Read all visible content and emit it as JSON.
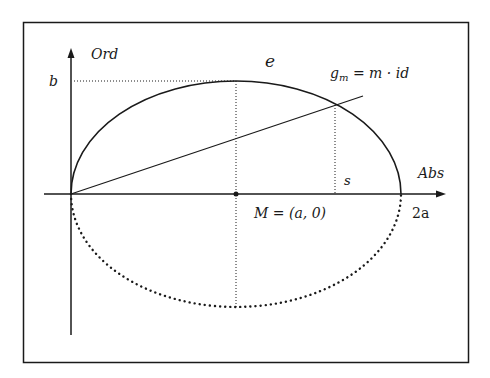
{
  "diagram": {
    "axis_labels": {
      "y": "Ord",
      "x": "Abs"
    },
    "tick_labels": {
      "b": "b",
      "two_a": "2a"
    },
    "curve_label": "e",
    "line_label": "g",
    "line_label_sub": "m",
    "line_label_rest": " = m · id",
    "center_label": "M = (a, 0)",
    "segment_label": "s",
    "colors": {
      "ink": "#1a1a1a",
      "background": "#ffffff"
    }
  }
}
